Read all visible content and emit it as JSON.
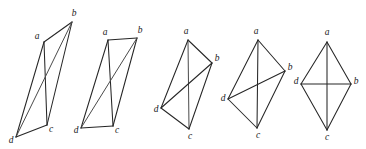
{
  "figure": {
    "background_color": "#ffffff",
    "edge_color": "#262626",
    "label_color": "#1a1a1a",
    "label_style": "italic-serif",
    "width": 366,
    "height": 149,
    "graph_count": 5
  },
  "chart_data": {
    "type": "diagram",
    "xlabel": "",
    "ylabel": "",
    "graphs": [
      {
        "index": 1,
        "name": "graph-1",
        "vertices": [
          {
            "id": "a",
            "label": "a",
            "x": 44,
            "y": 42,
            "label_x": 37,
            "label_y": 37
          },
          {
            "id": "b",
            "label": "b",
            "x": 72,
            "y": 22,
            "label_x": 74,
            "label_y": 14
          },
          {
            "id": "c",
            "label": "c",
            "x": 47,
            "y": 125,
            "label_x": 51,
            "label_y": 130
          },
          {
            "id": "d",
            "label": "d",
            "x": 16,
            "y": 137,
            "label_x": 11,
            "label_y": 141
          }
        ],
        "edges": [
          {
            "from": "a",
            "to": "b",
            "soft": false
          },
          {
            "from": "a",
            "to": "c",
            "soft": false
          },
          {
            "from": "a",
            "to": "d",
            "soft": false
          },
          {
            "from": "b",
            "to": "c",
            "soft": false
          },
          {
            "from": "b",
            "to": "d",
            "soft": true
          },
          {
            "from": "c",
            "to": "d",
            "soft": false
          }
        ]
      },
      {
        "index": 2,
        "name": "graph-2",
        "vertices": [
          {
            "id": "a",
            "label": "a",
            "x": 108,
            "y": 40,
            "label_x": 105,
            "label_y": 33
          },
          {
            "id": "b",
            "label": "b",
            "x": 137,
            "y": 38,
            "label_x": 140,
            "label_y": 31
          },
          {
            "id": "c",
            "label": "c",
            "x": 113,
            "y": 126,
            "label_x": 117,
            "label_y": 131
          },
          {
            "id": "d",
            "label": "d",
            "x": 81,
            "y": 128,
            "label_x": 76,
            "label_y": 131
          }
        ],
        "edges": [
          {
            "from": "a",
            "to": "b",
            "soft": false
          },
          {
            "from": "a",
            "to": "c",
            "soft": false
          },
          {
            "from": "a",
            "to": "d",
            "soft": false
          },
          {
            "from": "b",
            "to": "c",
            "soft": false
          },
          {
            "from": "b",
            "to": "d",
            "soft": true
          },
          {
            "from": "c",
            "to": "d",
            "soft": false
          }
        ]
      },
      {
        "index": 3,
        "name": "graph-3",
        "vertices": [
          {
            "id": "a",
            "label": "a",
            "x": 188,
            "y": 40,
            "label_x": 186,
            "label_y": 32
          },
          {
            "id": "b",
            "label": "b",
            "x": 212,
            "y": 63,
            "label_x": 217,
            "label_y": 59
          },
          {
            "id": "c",
            "label": "c",
            "x": 189,
            "y": 129,
            "label_x": 190,
            "label_y": 137
          },
          {
            "id": "d",
            "label": "d",
            "x": 161,
            "y": 108,
            "label_x": 156,
            "label_y": 110
          }
        ],
        "edges": [
          {
            "from": "a",
            "to": "b",
            "soft": false
          },
          {
            "from": "a",
            "to": "c",
            "soft": true
          },
          {
            "from": "a",
            "to": "d",
            "soft": false
          },
          {
            "from": "b",
            "to": "c",
            "soft": false
          },
          {
            "from": "b",
            "to": "d",
            "soft": false
          },
          {
            "from": "c",
            "to": "d",
            "soft": false
          }
        ]
      },
      {
        "index": 4,
        "name": "graph-4",
        "vertices": [
          {
            "id": "a",
            "label": "a",
            "x": 258,
            "y": 40,
            "label_x": 256,
            "label_y": 32
          },
          {
            "id": "b",
            "label": "b",
            "x": 285,
            "y": 71,
            "label_x": 290,
            "label_y": 68
          },
          {
            "id": "c",
            "label": "c",
            "x": 257,
            "y": 128,
            "label_x": 258,
            "label_y": 136
          },
          {
            "id": "d",
            "label": "d",
            "x": 228,
            "y": 99,
            "label_x": 223,
            "label_y": 99
          }
        ],
        "edges": [
          {
            "from": "a",
            "to": "b",
            "soft": false
          },
          {
            "from": "a",
            "to": "c",
            "soft": false
          },
          {
            "from": "a",
            "to": "d",
            "soft": false
          },
          {
            "from": "b",
            "to": "c",
            "soft": false
          },
          {
            "from": "b",
            "to": "d",
            "soft": false
          },
          {
            "from": "c",
            "to": "d",
            "soft": false
          }
        ]
      },
      {
        "index": 5,
        "name": "graph-5",
        "vertices": [
          {
            "id": "a",
            "label": "a",
            "x": 327,
            "y": 42,
            "label_x": 327,
            "label_y": 33
          },
          {
            "id": "b",
            "label": "b",
            "x": 351,
            "y": 84,
            "label_x": 356,
            "label_y": 82
          },
          {
            "id": "c",
            "label": "c",
            "x": 327,
            "y": 130,
            "label_x": 327,
            "label_y": 138
          },
          {
            "id": "d",
            "label": "d",
            "x": 301,
            "y": 84,
            "label_x": 296,
            "label_y": 82
          }
        ],
        "edges": [
          {
            "from": "a",
            "to": "b",
            "soft": false
          },
          {
            "from": "a",
            "to": "c",
            "soft": false
          },
          {
            "from": "a",
            "to": "d",
            "soft": false
          },
          {
            "from": "b",
            "to": "c",
            "soft": false
          },
          {
            "from": "b",
            "to": "d",
            "soft": false
          },
          {
            "from": "c",
            "to": "d",
            "soft": false
          }
        ]
      }
    ]
  }
}
